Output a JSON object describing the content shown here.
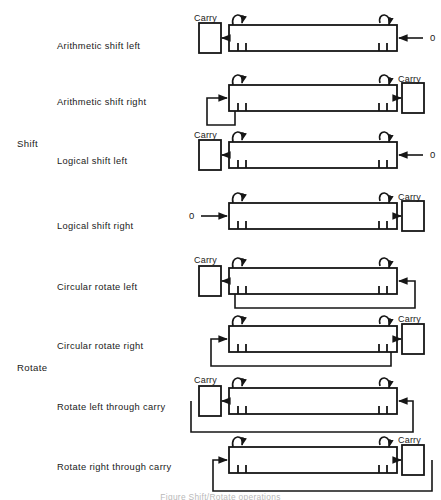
{
  "figure": {
    "caption": "Figure  Shift/Rotate operations",
    "groups": [
      {
        "name": "shift-group",
        "label": "Shift",
        "x": 17,
        "y": 139
      },
      {
        "name": "rotate-group",
        "label": "Rotate",
        "x": 17,
        "y": 363
      }
    ],
    "labels": {
      "carry": "Carry",
      "zero": "0"
    },
    "colors": {
      "ink": "#161616",
      "background": "#ffffff",
      "caption": "#b9b9b9"
    },
    "rows": [
      {
        "id": "arithmetic-shift-left",
        "label": "Arithmetic shift left",
        "label_y": 42,
        "reg_y": 25,
        "carry_side": "left",
        "carry_label_y": 14,
        "input_label": "0",
        "input_side": "right",
        "feedback": "none"
      },
      {
        "id": "arithmetic-shift-right",
        "label": "Arithmetic shift right",
        "label_y": 98,
        "reg_y": 85,
        "carry_side": "right",
        "carry_label_y": 75,
        "input_label": "",
        "input_side": "none",
        "feedback": "sign-extend"
      },
      {
        "id": "logical-shift-left",
        "label": "Logical shift left",
        "label_y": 157,
        "reg_y": 142,
        "carry_side": "left",
        "carry_label_y": 131,
        "input_label": "0",
        "input_side": "right",
        "feedback": "none"
      },
      {
        "id": "logical-shift-right",
        "label": "Logical shift right",
        "label_y": 222,
        "reg_y": 203,
        "carry_side": "right",
        "carry_label_y": 193,
        "input_label": "0",
        "input_side": "left",
        "feedback": "none"
      },
      {
        "id": "circular-rotate-left",
        "label": "Circular rotate left",
        "label_y": 283,
        "reg_y": 268,
        "carry_side": "left",
        "carry_label_y": 256,
        "input_label": "",
        "input_side": "none",
        "feedback": "wrap-left"
      },
      {
        "id": "circular-rotate-right",
        "label": "Circular rotate right",
        "label_y": 342,
        "reg_y": 326,
        "carry_side": "right",
        "carry_label_y": 315,
        "input_label": "",
        "input_side": "none",
        "feedback": "wrap-right"
      },
      {
        "id": "rotate-left-through-carry",
        "label": "Rotate left through carry",
        "label_y": 403,
        "reg_y": 388,
        "carry_side": "left",
        "carry_label_y": 376,
        "input_label": "",
        "input_side": "none",
        "feedback": "through-carry-left"
      },
      {
        "id": "rotate-right-through-carry",
        "label": "Rotate right through carry",
        "label_y": 463,
        "reg_y": 447,
        "carry_side": "right",
        "carry_label_y": 436,
        "input_label": "",
        "input_side": "none",
        "feedback": "through-carry-right"
      }
    ]
  }
}
